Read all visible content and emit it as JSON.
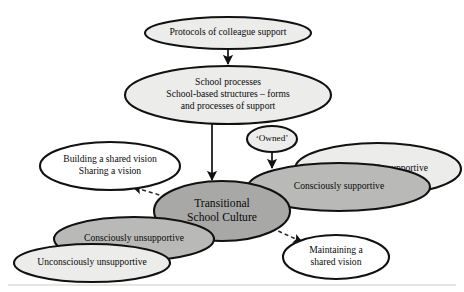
{
  "diagram": {
    "background_color": "#ffffff",
    "palette": {
      "outline": "#111111",
      "fill_white": "#ffffff",
      "fill_light_gray": "#ececeb",
      "fill_mid_gray": "#b9b9b7",
      "fill_dark_gray": "#a8a8a6",
      "text": "#0a0a0a",
      "footer_rule": "#c9c9c9"
    },
    "nodes": [
      {
        "id": "protocols",
        "name": "protocols-of-colleague-support",
        "lines": [
          "Protocols of colleague support"
        ],
        "fill": "#ececeb",
        "cx": 228,
        "cy": 33,
        "rx": 83,
        "ry": 16,
        "font_size": 9.6
      },
      {
        "id": "school-processes",
        "name": "school-processes",
        "lines": [
          "School processes",
          "School-based structures – forms",
          "and processes of support"
        ],
        "fill": "#ececeb",
        "cx": 228,
        "cy": 95,
        "rx": 103,
        "ry": 29,
        "font_size": 9.6
      },
      {
        "id": "owned",
        "name": "owned",
        "lines": [
          "‘Owned’"
        ],
        "fill": "#ececeb",
        "cx": 272,
        "cy": 139,
        "rx": 25,
        "ry": 13,
        "font_size": 9.2
      },
      {
        "id": "unconsciously-supportive",
        "name": "unconsciously-supportive",
        "lines": [
          "Unconsciously supportive"
        ],
        "fill": "#ececeb",
        "cx": 378,
        "cy": 169,
        "rx": 83,
        "ry": 26,
        "font_size": 9.6
      },
      {
        "id": "consciously-supportive",
        "name": "consciously-supportive",
        "lines": [
          "Consciously supportive"
        ],
        "fill": "#b9b9b7",
        "cx": 339,
        "cy": 187,
        "rx": 91,
        "ry": 24,
        "font_size": 9.6
      },
      {
        "id": "building-shared-vision",
        "name": "building-a-shared-vision",
        "lines": [
          "Building a shared vision",
          "Sharing a vision"
        ],
        "fill": "#ffffff",
        "cx": 110,
        "cy": 166,
        "rx": 70,
        "ry": 24,
        "font_size": 9.6
      },
      {
        "id": "transitional-school-culture",
        "name": "transitional-school-culture",
        "lines": [
          "Transitional",
          "School Culture"
        ],
        "fill": "#a8a8a6",
        "cx": 222,
        "cy": 211,
        "rx": 68,
        "ry": 30,
        "font_size": 11.6
      },
      {
        "id": "consciously-unsupportive",
        "name": "consciously-unsupportive",
        "lines": [
          "Consciously unsupportive"
        ],
        "fill": "#b9b9b7",
        "cx": 134,
        "cy": 239,
        "rx": 80,
        "ry": 22,
        "font_size": 9.6
      },
      {
        "id": "unconsciously-unsupportive",
        "name": "unconsciously-unsupportive",
        "lines": [
          "Unconsciously unsupportive"
        ],
        "fill": "#ececeb",
        "cx": 92,
        "cy": 263,
        "rx": 78,
        "ry": 19,
        "font_size": 9.6
      },
      {
        "id": "maintaining-shared-vision",
        "name": "maintaining-a-shared-vision",
        "lines": [
          "Maintaining a",
          "shared vision"
        ],
        "fill": "#ffffff",
        "cx": 336,
        "cy": 257,
        "rx": 53,
        "ry": 22,
        "font_size": 9.6
      }
    ],
    "edges": [
      {
        "id": "edge-protocols-to-processes",
        "name": "arrow-protocols-to-school-processes",
        "style": "solid",
        "from": "protocols",
        "to": "school-processes",
        "path": "M 228 49 L 228 64"
      },
      {
        "id": "edge-processes-to-culture",
        "name": "arrow-school-processes-to-transitional-culture",
        "style": "solid",
        "from": "school-processes",
        "to": "transitional-school-culture",
        "path": "M 212 124 L 212 180"
      },
      {
        "id": "edge-owned-to-consciously-supportive",
        "name": "arrow-owned-to-consciously-supportive",
        "style": "solid",
        "from": "owned",
        "to": "consciously-supportive",
        "path": "M 272 152 L 272 168"
      },
      {
        "id": "edge-culture-to-building",
        "name": "dashed-arrow-culture-to-building-a-shared-vision",
        "style": "dashed",
        "from": "transitional-school-culture",
        "to": "building-shared-vision",
        "path": "M 166 197 L 133 187"
      },
      {
        "id": "edge-culture-to-maintaining",
        "name": "dashed-arrow-culture-to-maintaining-a-shared-vision",
        "style": "dashed",
        "from": "transitional-school-culture",
        "to": "maintaining-shared-vision",
        "path": "M 272 228 L 302 242"
      }
    ],
    "footer_rule": {
      "name": "footer-divider",
      "y": 285,
      "x1": 8,
      "x2": 456
    }
  }
}
